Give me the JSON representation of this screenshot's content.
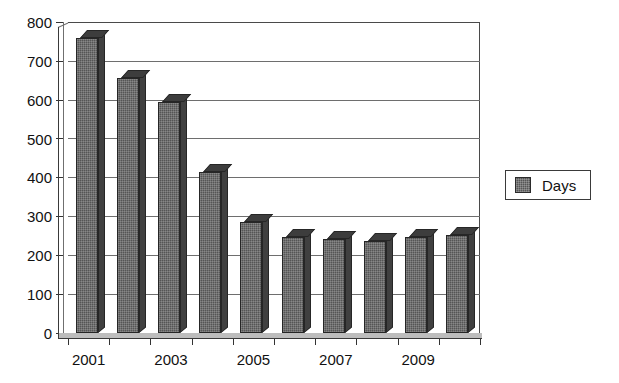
{
  "chart_data": {
    "type": "bar",
    "title": "",
    "xlabel": "",
    "ylabel": "",
    "categories": [
      "2001",
      "2002",
      "2003",
      "2004",
      "2005",
      "2006",
      "2007",
      "2008",
      "2009",
      "2010"
    ],
    "values": [
      760,
      655,
      593,
      415,
      285,
      248,
      243,
      237,
      246,
      252
    ],
    "series": [
      {
        "name": "Days",
        "values": [
          760,
          655,
          593,
          415,
          285,
          248,
          243,
          237,
          246,
          252
        ]
      }
    ],
    "ylim": [
      0,
      800
    ],
    "ytick_values": [
      0,
      100,
      200,
      300,
      400,
      500,
      600,
      700,
      800
    ],
    "ytick_labels": [
      "0",
      "100",
      "200",
      "300",
      "400",
      "500",
      "600",
      "700",
      "800"
    ],
    "xtick_labels_visible": [
      "2001",
      "2003",
      "2005",
      "2007",
      "2009"
    ],
    "grid": true,
    "legend": {
      "position": "right",
      "entries": [
        {
          "label": "Days",
          "color": "#555555"
        }
      ]
    },
    "bar_color": "#555555",
    "style_3d": true
  },
  "legend": {
    "label": "Days"
  }
}
